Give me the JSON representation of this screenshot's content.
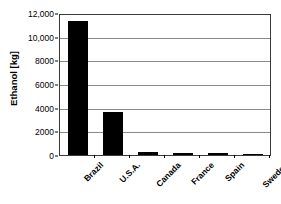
{
  "chart_data": {
    "type": "bar",
    "title": "",
    "subtitle": "",
    "xlabel": "",
    "ylabel": "Ethanol [kg]",
    "categories": [
      "Brazil",
      "U.S.A.",
      "Canada",
      "France",
      "Spain",
      "Sweden"
    ],
    "values": [
      11300,
      3650,
      250,
      150,
      150,
      20
    ],
    "ylim": [
      0,
      12000
    ],
    "y_ticks": [
      0,
      2000,
      4000,
      6000,
      8000,
      10000,
      12000
    ],
    "y_tick_labels": [
      "0",
      "2000",
      "4000",
      "6000",
      "8000",
      "10,000",
      "12,000"
    ],
    "grid": true,
    "grid_axis": "y",
    "legend": false,
    "legend_position": "none",
    "bar_color": "#000000",
    "gridline_color": "#8a8a8a",
    "axis_color": "#3a3a3a",
    "background_color": "#ffffff",
    "x_tick_label_rotation": -45
  }
}
